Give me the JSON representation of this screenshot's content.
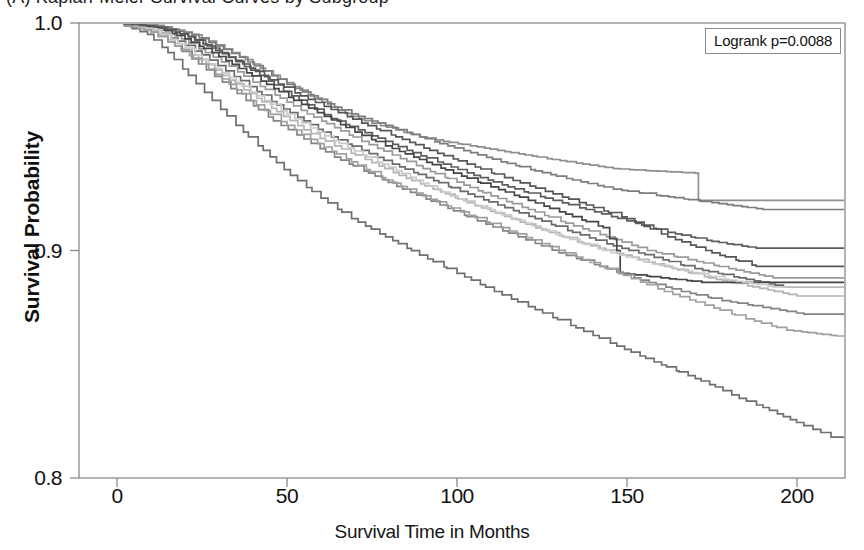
{
  "figure": {
    "panel_label": "(A)",
    "title_partial": "(A)   Kaplan-Meier  Survival  Curves  by  Subgroup",
    "background_color": "#ffffff"
  },
  "legend": {
    "text": "Logrank p=0.0088",
    "border_color": "#8c8c8c"
  },
  "axes": {
    "ylabel": "Survival Probability",
    "xlabel": "Survival Time in Months",
    "yticks": [
      "1.0",
      "0.9",
      "0.8"
    ],
    "xticks": [
      "0",
      "50",
      "100",
      "150",
      "200"
    ],
    "frame_color": "#8a8a8a"
  },
  "chart_data": {
    "type": "line",
    "title": "Kaplan-Meier Survival Curves",
    "subtitle": "Logrank p=0.0088",
    "xlabel": "Survival Time in Months",
    "ylabel": "Survival Probability",
    "xlim": [
      0,
      214
    ],
    "ylim": [
      0.8,
      1.0
    ],
    "xticks": [
      0,
      50,
      100,
      150,
      200
    ],
    "yticks": [
      0.8,
      0.9,
      1.0
    ],
    "grid": false,
    "legend_position": "top-right",
    "annotations": [
      {
        "text": "Logrank p=0.0088",
        "x": 180,
        "y": 0.99
      }
    ],
    "series": [
      {
        "name": "group-1",
        "color": "#8f8f8f",
        "final_value": 0.922,
        "x": [
          0,
          12,
          20,
          27,
          34,
          40,
          46,
          52,
          58,
          63,
          69,
          75,
          82,
          89,
          96,
          104,
          112,
          120,
          128,
          137,
          146,
          157,
          170,
          171,
          214
        ],
        "y": [
          1.0,
          0.999,
          0.996,
          0.992,
          0.987,
          0.982,
          0.977,
          0.972,
          0.967,
          0.963,
          0.959,
          0.956,
          0.953,
          0.95,
          0.948,
          0.946,
          0.944,
          0.942,
          0.94,
          0.938,
          0.936,
          0.935,
          0.934,
          0.922,
          0.922
        ]
      },
      {
        "name": "group-2",
        "color": "#7d7d7d",
        "final_value": 0.918,
        "x": [
          0,
          14,
          22,
          29,
          36,
          43,
          50,
          57,
          64,
          71,
          79,
          87,
          95,
          104,
          113,
          123,
          134,
          146,
          160,
          175,
          190,
          214
        ],
        "y": [
          1.0,
          0.998,
          0.995,
          0.99,
          0.985,
          0.979,
          0.973,
          0.968,
          0.963,
          0.959,
          0.955,
          0.951,
          0.947,
          0.943,
          0.939,
          0.935,
          0.931,
          0.927,
          0.924,
          0.921,
          0.918,
          0.918
        ]
      },
      {
        "name": "group-3",
        "color": "#5d5d5d",
        "final_value": 0.901,
        "x": [
          0,
          13,
          21,
          28,
          35,
          42,
          49,
          56,
          63,
          71,
          79,
          87,
          96,
          105,
          115,
          126,
          138,
          150,
          162,
          175,
          188,
          214
        ],
        "y": [
          1.0,
          0.998,
          0.994,
          0.989,
          0.983,
          0.977,
          0.97,
          0.964,
          0.958,
          0.953,
          0.948,
          0.943,
          0.938,
          0.933,
          0.928,
          0.923,
          0.918,
          0.913,
          0.908,
          0.904,
          0.901,
          0.901
        ]
      },
      {
        "name": "group-4",
        "color": "#9a9a9a",
        "final_value": 0.888,
        "x": [
          0,
          12,
          19,
          26,
          33,
          40,
          48,
          56,
          64,
          72,
          81,
          90,
          100,
          110,
          121,
          132,
          144,
          156,
          168,
          180,
          193,
          214
        ],
        "y": [
          1.0,
          0.998,
          0.993,
          0.987,
          0.981,
          0.974,
          0.967,
          0.96,
          0.954,
          0.948,
          0.942,
          0.936,
          0.93,
          0.924,
          0.918,
          0.912,
          0.906,
          0.9,
          0.896,
          0.892,
          0.888,
          0.888
        ]
      },
      {
        "name": "group-5",
        "color": "#6b6b6b",
        "final_value": 0.884,
        "x": [
          0,
          11,
          18,
          25,
          32,
          39,
          47,
          55,
          63,
          72,
          81,
          91,
          101,
          112,
          123,
          134,
          146,
          158,
          170,
          183,
          196,
          214
        ],
        "y": [
          1.0,
          0.997,
          0.992,
          0.986,
          0.979,
          0.972,
          0.964,
          0.957,
          0.95,
          0.944,
          0.938,
          0.932,
          0.926,
          0.92,
          0.914,
          0.908,
          0.902,
          0.897,
          0.892,
          0.888,
          0.884,
          0.884
        ]
      },
      {
        "name": "group-6",
        "color": "#b4b4b4",
        "final_value": 0.88,
        "x": [
          0,
          10,
          17,
          24,
          31,
          39,
          47,
          55,
          64,
          73,
          83,
          93,
          103,
          114,
          125,
          137,
          149,
          161,
          174,
          187,
          200,
          214
        ],
        "y": [
          1.0,
          0.997,
          0.991,
          0.984,
          0.977,
          0.969,
          0.961,
          0.953,
          0.946,
          0.94,
          0.933,
          0.927,
          0.921,
          0.915,
          0.909,
          0.903,
          0.898,
          0.893,
          0.888,
          0.884,
          0.88,
          0.88
        ]
      },
      {
        "name": "group-7",
        "color": "#454545",
        "final_value": 0.886,
        "x": [
          0,
          12,
          20,
          28,
          36,
          44,
          52,
          61,
          70,
          79,
          89,
          99,
          110,
          121,
          132,
          143,
          147,
          148,
          160,
          172,
          214
        ],
        "y": [
          1.0,
          0.998,
          0.993,
          0.987,
          0.98,
          0.973,
          0.966,
          0.959,
          0.952,
          0.946,
          0.94,
          0.934,
          0.928,
          0.922,
          0.916,
          0.91,
          0.9,
          0.89,
          0.888,
          0.886,
          0.886
        ]
      },
      {
        "name": "group-8",
        "color": "#848484",
        "final_value": 0.872,
        "x": [
          0,
          10,
          17,
          24,
          31,
          38,
          46,
          55,
          64,
          74,
          84,
          95,
          106,
          118,
          130,
          142,
          154,
          166,
          178,
          190,
          202,
          214
        ],
        "y": [
          1.0,
          0.996,
          0.99,
          0.982,
          0.974,
          0.966,
          0.957,
          0.949,
          0.941,
          0.934,
          0.927,
          0.92,
          0.913,
          0.906,
          0.899,
          0.893,
          0.887,
          0.882,
          0.878,
          0.875,
          0.872,
          0.872
        ]
      },
      {
        "name": "group-9",
        "color": "#c9c9c9",
        "final_value": 0.884,
        "x": [
          0,
          11,
          18,
          25,
          33,
          41,
          50,
          59,
          68,
          78,
          88,
          98,
          109,
          120,
          131,
          143,
          155,
          167,
          180,
          193,
          214
        ],
        "y": [
          1.0,
          0.997,
          0.991,
          0.984,
          0.976,
          0.968,
          0.96,
          0.952,
          0.945,
          0.938,
          0.931,
          0.924,
          0.918,
          0.912,
          0.906,
          0.9,
          0.895,
          0.891,
          0.887,
          0.884,
          0.884
        ]
      },
      {
        "name": "group-10",
        "color": "#6f6f6f",
        "final_value": 0.818,
        "x": [
          0,
          9,
          15,
          21,
          28,
          35,
          43,
          51,
          60,
          69,
          79,
          89,
          100,
          111,
          123,
          135,
          147,
          158,
          168,
          176,
          183,
          190,
          196,
          202,
          207,
          210,
          214
        ],
        "y": [
          1.0,
          0.995,
          0.987,
          0.977,
          0.966,
          0.955,
          0.944,
          0.933,
          0.923,
          0.914,
          0.906,
          0.898,
          0.89,
          0.882,
          0.874,
          0.866,
          0.858,
          0.851,
          0.845,
          0.84,
          0.835,
          0.831,
          0.827,
          0.823,
          0.82,
          0.818,
          0.818
        ]
      },
      {
        "name": "group-11",
        "color": "#a0a0a0",
        "final_value": 0.862,
        "x": [
          0,
          10,
          17,
          25,
          33,
          41,
          50,
          59,
          69,
          79,
          90,
          101,
          113,
          125,
          137,
          149,
          161,
          173,
          185,
          197,
          214
        ],
        "y": [
          1.0,
          0.996,
          0.99,
          0.982,
          0.973,
          0.964,
          0.955,
          0.947,
          0.939,
          0.931,
          0.924,
          0.917,
          0.91,
          0.903,
          0.896,
          0.889,
          0.882,
          0.876,
          0.87,
          0.865,
          0.862
        ]
      },
      {
        "name": "group-12",
        "color": "#565656",
        "final_value": 0.893,
        "x": [
          0,
          13,
          21,
          29,
          37,
          45,
          54,
          63,
          72,
          82,
          92,
          103,
          114,
          126,
          138,
          150,
          162,
          175,
          188,
          214
        ],
        "y": [
          1.0,
          0.998,
          0.994,
          0.988,
          0.982,
          0.975,
          0.968,
          0.962,
          0.956,
          0.95,
          0.944,
          0.938,
          0.932,
          0.926,
          0.92,
          0.914,
          0.906,
          0.899,
          0.893,
          0.893
        ]
      }
    ]
  }
}
